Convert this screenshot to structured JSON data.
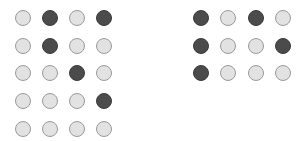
{
  "colors": {
    "filled": "#4b4b4b",
    "empty": "#e2e2e2",
    "empty_border": "#9a9a9a"
  },
  "left_grid": {
    "rows": 5,
    "cols": 4,
    "cells": [
      [
        0,
        1,
        0,
        1
      ],
      [
        0,
        1,
        0,
        0
      ],
      [
        0,
        0,
        1,
        0
      ],
      [
        0,
        0,
        0,
        1
      ],
      [
        0,
        0,
        0,
        0
      ]
    ]
  },
  "right_grid": {
    "rows": 3,
    "cols": 4,
    "cells": [
      [
        1,
        0,
        1,
        0
      ],
      [
        1,
        0,
        0,
        1
      ],
      [
        1,
        0,
        0,
        0
      ]
    ]
  }
}
